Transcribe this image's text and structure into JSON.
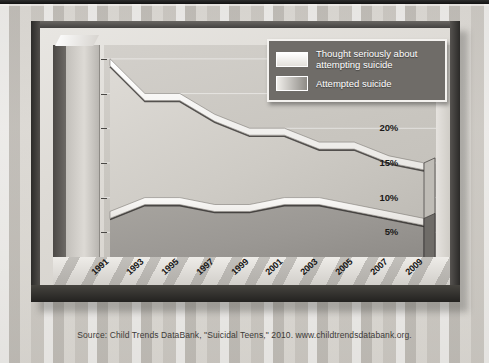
{
  "chart_data": {
    "type": "area",
    "title": "",
    "subtitle": "",
    "xlabel": "",
    "ylabel": "",
    "categories": [
      "1991",
      "1993",
      "1995",
      "1997",
      "1999",
      "2001",
      "2003",
      "2005",
      "2007",
      "2009"
    ],
    "series": [
      {
        "name": "Thought seriously about attempting suicide",
        "values": [
          29,
          24,
          24,
          21,
          19,
          19,
          17,
          17,
          15,
          14
        ]
      },
      {
        "name": "Attempted suicide",
        "values": [
          7,
          9,
          9,
          8,
          8,
          9,
          9,
          8,
          7,
          6
        ]
      }
    ],
    "ylim": [
      0,
      32
    ],
    "yticks": [
      0,
      5,
      10,
      15,
      20,
      25,
      30
    ],
    "ytick_labels": [
      "0%",
      "5%",
      "10%",
      "15%",
      "20%",
      "25%",
      "30%"
    ],
    "grid": true,
    "legend_position": "top-right",
    "style": "3d-area"
  },
  "legend": {
    "items": [
      {
        "label": "Thought seriously about\nattempting suicide",
        "swatch": "light-gradient"
      },
      {
        "label": "Attempted suicide",
        "swatch": "gray-gradient"
      }
    ]
  },
  "source": {
    "text": "Source: Child Trends DataBank, \"Suicidal Teens,\" 2010. www.childtrendsdatabank.org."
  },
  "colors": {
    "frame": "#3d3b39",
    "plot_background": "#c9c6c0",
    "series_top": "#ffffff",
    "series_bottom": "#8e8b86",
    "legend_background": "#6f6c68",
    "text": "#171615"
  }
}
